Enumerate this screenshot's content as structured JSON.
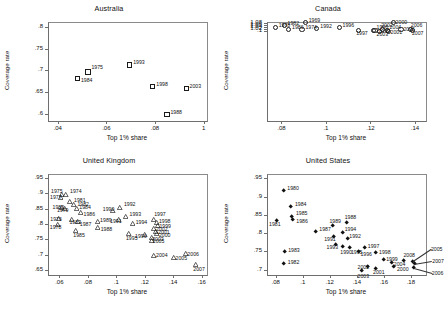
{
  "figure": {
    "panels": [
      "Australia",
      "Canada",
      "United Kingdom",
      "United States"
    ],
    "axis_titles": {
      "x": "Top 1% share",
      "y": "Coverage rate"
    }
  },
  "chart_data": [
    {
      "type": "scatter",
      "title": "Australia",
      "xlabel": "Top 1% share",
      "ylabel": "Coverage rate",
      "marker": "open-square",
      "xlim": [
        0.036,
        0.101
      ],
      "ylim": [
        0.585,
        0.812
      ],
      "xticks": [
        ".04",
        ".06",
        ".08",
        "1"
      ],
      "xtickvals": [
        0.04,
        0.06,
        0.08,
        0.1
      ],
      "yticks": [
        ".6",
        ".65",
        ".7",
        ".75",
        ".8"
      ],
      "ytickvals": [
        0.6,
        0.65,
        0.7,
        0.75,
        0.8
      ],
      "grid": false,
      "points": [
        {
          "label": "1984",
          "x": 0.0475,
          "y": 0.684,
          "lx": 4,
          "ly": 2
        },
        {
          "label": "1975",
          "x": 0.0518,
          "y": 0.7,
          "lx": 4,
          "ly": -4
        },
        {
          "label": "1993",
          "x": 0.069,
          "y": 0.716,
          "lx": 4,
          "ly": -2
        },
        {
          "label": "1998",
          "x": 0.0785,
          "y": 0.666,
          "lx": 4,
          "ly": -2
        },
        {
          "label": "2003",
          "x": 0.0922,
          "y": 0.661,
          "lx": 4,
          "ly": -2
        },
        {
          "label": "1988",
          "x": 0.0843,
          "y": 0.601,
          "lx": 4,
          "ly": -2
        }
      ]
    },
    {
      "type": "scatter",
      "title": "Canada",
      "xlabel": "Top 1% share",
      "ylabel": "Coverage rate",
      "marker": "open-circle",
      "xlim": [
        0.0735,
        0.1445
      ],
      "ylim": [
        0.0955,
        1.0885
      ],
      "xticks": [
        ".08",
        ".1",
        ".12",
        ".14"
      ],
      "xtickvals": [
        0.08,
        0.1,
        0.12,
        0.14
      ],
      "yticks": [
        ".1",
        "1.02",
        "1.04",
        "1.06",
        "1.08"
      ],
      "ytickvals": [
        1.0,
        1.02,
        1.04,
        1.06,
        1.08
      ],
      "grid": false,
      "points": [
        {
          "label": "1982",
          "x": 0.0805,
          "y": 1.0685,
          "lx": 4,
          "ly": -2
        },
        {
          "label": "1978",
          "x": 0.0765,
          "y": 1.0455,
          "lx": 4,
          "ly": -2
        },
        {
          "label": "1986",
          "x": 0.0825,
          "y": 1.0325,
          "lx": 4,
          "ly": -2
        },
        {
          "label": "1974",
          "x": 0.0885,
          "y": 1.0255,
          "lx": 4,
          "ly": -2
        },
        {
          "label": "1992",
          "x": 0.0952,
          "y": 1.036,
          "lx": 4,
          "ly": -2
        },
        {
          "label": "1969",
          "x": 0.09,
          "y": 1.096,
          "lx": 4,
          "ly": -2
        },
        {
          "label": "1996",
          "x": 0.1052,
          "y": 1.045,
          "lx": 4,
          "ly": -2
        },
        {
          "label": "1997",
          "x": 0.114,
          "y": 1.0165,
          "lx": -2,
          "ly": 3
        },
        {
          "label": "1998",
          "x": 0.1205,
          "y": 1.0175,
          "lx": 4,
          "ly": -3
        },
        {
          "label": "1999",
          "x": 0.1213,
          "y": 1.0145,
          "lx": 4,
          "ly": 1
        },
        {
          "label": "2003",
          "x": 0.1232,
          "y": 1.0055,
          "lx": -2,
          "ly": 3
        },
        {
          "label": "2002",
          "x": 0.1248,
          "y": 1.0305,
          "lx": -1,
          "ly": -4
        },
        {
          "label": "2004",
          "x": 0.1268,
          "y": 1.0155,
          "lx": 3,
          "ly": -3
        },
        {
          "label": "2001",
          "x": 0.1272,
          "y": 1.0115,
          "lx": 3,
          "ly": 1
        },
        {
          "label": "2000",
          "x": 0.1295,
          "y": 1.0975,
          "lx": 3,
          "ly": 0
        },
        {
          "label": "2005",
          "x": 0.133,
          "y": 1.0265,
          "lx": 3,
          "ly": 0
        },
        {
          "label": "2006",
          "x": 0.1372,
          "y": 1.03,
          "lx": 1,
          "ly": -4
        },
        {
          "label": "2007",
          "x": 0.1382,
          "y": 1.0155,
          "lx": 0,
          "ly": 3
        }
      ]
    },
    {
      "type": "scatter",
      "title": "United Kingdom",
      "xlabel": "Top 1% share",
      "ylabel": "Coverage rate",
      "marker": "open-triangle",
      "xlim": [
        0.052,
        0.163
      ],
      "ylim": [
        0.638,
        0.962
      ],
      "xticks": [
        ".06",
        ".08",
        ".1",
        ".12",
        ".14",
        ".16"
      ],
      "xtickvals": [
        0.06,
        0.08,
        0.1,
        0.12,
        0.14,
        0.16
      ],
      "yticks": [
        ".65",
        ".7",
        ".75",
        ".8",
        ".85",
        ".9",
        ".95"
      ],
      "ytickvals": [
        0.65,
        0.7,
        0.75,
        0.8,
        0.85,
        0.9,
        0.95
      ],
      "grid": false,
      "points": [
        {
          "label": "1975",
          "x": 0.0605,
          "y": 0.898,
          "lx": -10,
          "ly": -4
        },
        {
          "label": "1974",
          "x": 0.064,
          "y": 0.9,
          "lx": 4,
          "ly": -3
        },
        {
          "label": "1977",
          "x": 0.0598,
          "y": 0.888,
          "lx": -10,
          "ly": -1
        },
        {
          "label": "1981",
          "x": 0.0668,
          "y": 0.876,
          "lx": 4,
          "ly": -2
        },
        {
          "label": "1982",
          "x": 0.0692,
          "y": 0.866,
          "lx": 4,
          "ly": -1
        },
        {
          "label": "1980",
          "x": 0.0608,
          "y": 0.858,
          "lx": -9,
          "ly": 0
        },
        {
          "label": "1979",
          "x": 0.0632,
          "y": 0.852,
          "lx": -8,
          "ly": 1
        },
        {
          "label": "1984",
          "x": 0.0712,
          "y": 0.852,
          "lx": 3,
          "ly": -2
        },
        {
          "label": "1986",
          "x": 0.0742,
          "y": 0.84,
          "lx": 3,
          "ly": 1
        },
        {
          "label": "1990",
          "x": 0.0968,
          "y": 0.848,
          "lx": -10,
          "ly": -1
        },
        {
          "label": "1992",
          "x": 0.1018,
          "y": 0.858,
          "lx": 4,
          "ly": -3
        },
        {
          "label": "1976",
          "x": 0.0585,
          "y": 0.822,
          "lx": -8,
          "ly": 1
        },
        {
          "label": "1983",
          "x": 0.0678,
          "y": 0.818,
          "lx": -2,
          "ly": 3
        },
        {
          "label": "1987",
          "x": 0.0722,
          "y": 0.812,
          "lx": 2,
          "ly": 3
        },
        {
          "label": "1989",
          "x": 0.0858,
          "y": 0.812,
          "lx": 3,
          "ly": -1
        },
        {
          "label": "1991",
          "x": 0.1012,
          "y": 0.818,
          "lx": -9,
          "ly": 2
        },
        {
          "label": "1993",
          "x": 0.1058,
          "y": 0.828,
          "lx": 4,
          "ly": -2
        },
        {
          "label": "1978",
          "x": 0.0582,
          "y": 0.8,
          "lx": -8,
          "ly": 2
        },
        {
          "label": "1988",
          "x": 0.0862,
          "y": 0.79,
          "lx": 3,
          "ly": 1
        },
        {
          "label": "1994",
          "x": 0.1108,
          "y": 0.805,
          "lx": 3,
          "ly": -1
        },
        {
          "label": "1985",
          "x": 0.0705,
          "y": 0.782,
          "lx": -2,
          "ly": 4
        },
        {
          "label": "1995",
          "x": 0.1082,
          "y": 0.772,
          "lx": -3,
          "ly": 4
        },
        {
          "label": "1997",
          "x": 0.1252,
          "y": 0.818,
          "lx": 1,
          "ly": -5
        },
        {
          "label": "1998",
          "x": 0.1278,
          "y": 0.808,
          "lx": 2,
          "ly": -2
        },
        {
          "label": "1999",
          "x": 0.1282,
          "y": 0.798,
          "lx": 2,
          "ly": 0
        },
        {
          "label": "2002",
          "x": 0.1258,
          "y": 0.788,
          "lx": 2,
          "ly": 0
        },
        {
          "label": "2001",
          "x": 0.1272,
          "y": 0.78,
          "lx": 2,
          "ly": 1
        },
        {
          "label": "2000",
          "x": 0.1278,
          "y": 0.772,
          "lx": 2,
          "ly": 1
        },
        {
          "label": "1996",
          "x": 0.1195,
          "y": 0.768,
          "lx": -10,
          "ly": 1
        },
        {
          "label": "2003",
          "x": 0.1238,
          "y": 0.758,
          "lx": 1,
          "ly": 1
        },
        {
          "label": "2005",
          "x": 0.1242,
          "y": 0.75,
          "lx": 1,
          "ly": 1
        },
        {
          "label": "2004",
          "x": 0.1258,
          "y": 0.702,
          "lx": 2,
          "ly": 0
        },
        {
          "label": "2005",
          "x": 0.1395,
          "y": 0.694,
          "lx": 2,
          "ly": 0
        },
        {
          "label": "2006",
          "x": 0.1478,
          "y": 0.706,
          "lx": 2,
          "ly": 0
        },
        {
          "label": "2007",
          "x": 0.1548,
          "y": 0.672,
          "lx": -2,
          "ly": 4
        }
      ]
    },
    {
      "type": "scatter",
      "title": "United States",
      "xlabel": "Top 1% share",
      "ylabel": "Coverage rate",
      "marker": "filled-diamond",
      "xlim": [
        0.0735,
        0.1905
      ],
      "ylim": [
        0.688,
        0.962
      ],
      "xticks": [
        ".08",
        ".1",
        ".12",
        ".14",
        ".16",
        ".18"
      ],
      "xtickvals": [
        0.08,
        0.1,
        0.12,
        0.14,
        0.16,
        0.18
      ],
      "yticks": [
        ".7",
        ".75",
        ".8",
        ".85",
        ".9",
        ".95"
      ],
      "ytickvals": [
        0.7,
        0.75,
        0.8,
        0.85,
        0.9,
        0.95
      ],
      "grid": false,
      "points": [
        {
          "label": "1980",
          "x": 0.0848,
          "y": 0.92,
          "lx": 4,
          "ly": -2
        },
        {
          "label": "1984",
          "x": 0.0905,
          "y": 0.876,
          "lx": 4,
          "ly": -2
        },
        {
          "label": "1985",
          "x": 0.0912,
          "y": 0.848,
          "lx": 4,
          "ly": -4
        },
        {
          "label": "1986",
          "x": 0.0915,
          "y": 0.84,
          "lx": 4,
          "ly": 1
        },
        {
          "label": "1981",
          "x": 0.0802,
          "y": 0.838,
          "lx": -8,
          "ly": 4
        },
        {
          "label": "1983",
          "x": 0.0855,
          "y": 0.752,
          "lx": 4,
          "ly": -2
        },
        {
          "label": "1982",
          "x": 0.0852,
          "y": 0.718,
          "lx": 4,
          "ly": -2
        },
        {
          "label": "1987",
          "x": 0.1085,
          "y": 0.808,
          "lx": 4,
          "ly": -2
        },
        {
          "label": "1989",
          "x": 0.1212,
          "y": 0.822,
          "lx": -3,
          "ly": -5
        },
        {
          "label": "1988",
          "x": 0.1318,
          "y": 0.832,
          "lx": -2,
          "ly": -5
        },
        {
          "label": "1994",
          "x": 0.1288,
          "y": 0.805,
          "lx": 2,
          "ly": -3
        },
        {
          "label": "1991",
          "x": 0.1218,
          "y": 0.792,
          "lx": -9,
          "ly": 2
        },
        {
          "label": "1992",
          "x": 0.1322,
          "y": 0.788,
          "lx": 2,
          "ly": -3
        },
        {
          "label": "1993",
          "x": 0.1235,
          "y": 0.772,
          "lx": -9,
          "ly": 3
        },
        {
          "label": "1990",
          "x": 0.1285,
          "y": 0.766,
          "lx": -2,
          "ly": 5
        },
        {
          "label": "1995",
          "x": 0.1342,
          "y": 0.762,
          "lx": 1,
          "ly": 4
        },
        {
          "label": "1996",
          "x": 0.1405,
          "y": 0.752,
          "lx": 2,
          "ly": 2
        },
        {
          "label": "1997",
          "x": 0.1452,
          "y": 0.762,
          "lx": 3,
          "ly": -2
        },
        {
          "label": "1998",
          "x": 0.1535,
          "y": 0.748,
          "lx": 3,
          "ly": -1
        },
        {
          "label": "1999",
          "x": 0.1588,
          "y": 0.73,
          "lx": 3,
          "ly": -1
        },
        {
          "label": "2004",
          "x": 0.1652,
          "y": 0.722,
          "lx": 2,
          "ly": 1
        },
        {
          "label": "2000",
          "x": 0.1668,
          "y": 0.71,
          "lx": 3,
          "ly": 2
        },
        {
          "label": "2002",
          "x": 0.1472,
          "y": 0.71,
          "lx": -10,
          "ly": 0
        },
        {
          "label": "2001",
          "x": 0.1535,
          "y": 0.706,
          "lx": -3,
          "ly": 4
        },
        {
          "label": "2003",
          "x": 0.1428,
          "y": 0.7,
          "lx": -4,
          "ly": 5
        },
        {
          "label": "2008",
          "x": 0.1738,
          "y": 0.728,
          "lx": 0,
          "ly": -5
        },
        {
          "label": "2005",
          "x": 0.1808,
          "y": 0.725,
          "lx": 18,
          "ly": -12,
          "leader": true
        },
        {
          "label": "2007",
          "x": 0.1818,
          "y": 0.718,
          "lx": 18,
          "ly": -3,
          "leader": true
        },
        {
          "label": "2006",
          "x": 0.1815,
          "y": 0.708,
          "lx": 18,
          "ly": 5,
          "leader": true
        }
      ]
    }
  ]
}
